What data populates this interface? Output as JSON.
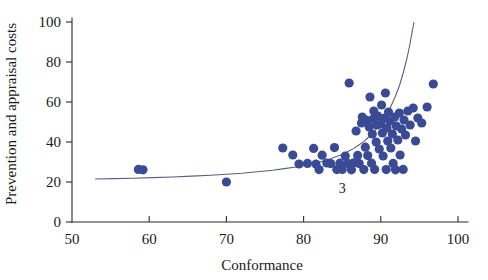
{
  "chart_data": {
    "type": "scatter",
    "title": "",
    "xlabel": "Conformance",
    "ylabel": "Prevention and appraisal costs",
    "xlim": [
      50,
      100
    ],
    "ylim": [
      0,
      100
    ],
    "xticks": [
      50,
      60,
      70,
      80,
      90,
      100
    ],
    "yticks": [
      0,
      20,
      40,
      60,
      80,
      100
    ],
    "grid": false,
    "legend": false,
    "marker_color": "#3a4a94",
    "curve_color": "#5a5f82",
    "axis_color": "#2b2b2b",
    "annotations": [
      {
        "text": "3",
        "x": 85.0,
        "y": 14.5
      }
    ],
    "series": [
      {
        "name": "observations",
        "marker": "circle",
        "points": [
          [
            58.6,
            26.3
          ],
          [
            59.2,
            26.1
          ],
          [
            70.0,
            20.0
          ],
          [
            77.3,
            37.0
          ],
          [
            78.6,
            33.5
          ],
          [
            79.4,
            29.0
          ],
          [
            80.5,
            29.3
          ],
          [
            81.3,
            36.8
          ],
          [
            81.6,
            29.0
          ],
          [
            82.0,
            26.2
          ],
          [
            82.4,
            33.4
          ],
          [
            83.0,
            29.5
          ],
          [
            83.5,
            29.2
          ],
          [
            84.0,
            37.2
          ],
          [
            84.3,
            26.2
          ],
          [
            84.7,
            29.4
          ],
          [
            85.0,
            26.3
          ],
          [
            85.4,
            33.0
          ],
          [
            85.7,
            29.3
          ],
          [
            85.9,
            69.5
          ],
          [
            86.2,
            26.1
          ],
          [
            86.5,
            29.6
          ],
          [
            86.8,
            45.5
          ],
          [
            87.0,
            33.3
          ],
          [
            87.2,
            29.2
          ],
          [
            87.5,
            49.5
          ],
          [
            87.6,
            52.5
          ],
          [
            87.8,
            26.2
          ],
          [
            88.0,
            37.4
          ],
          [
            88.1,
            51.0
          ],
          [
            88.3,
            33.2
          ],
          [
            88.5,
            47.5
          ],
          [
            88.6,
            62.5
          ],
          [
            88.8,
            29.4
          ],
          [
            88.9,
            44.0
          ],
          [
            89.0,
            51.5
          ],
          [
            89.1,
            55.5
          ],
          [
            89.2,
            26.3
          ],
          [
            89.4,
            40.0
          ],
          [
            89.5,
            48.5
          ],
          [
            89.6,
            53.0
          ],
          [
            89.8,
            36.5
          ],
          [
            90.0,
            49.0
          ],
          [
            90.1,
            58.5
          ],
          [
            90.2,
            44.5
          ],
          [
            90.3,
            33.0
          ],
          [
            90.5,
            52.0
          ],
          [
            90.6,
            64.5
          ],
          [
            90.7,
            26.2
          ],
          [
            90.8,
            47.0
          ],
          [
            90.9,
            40.5
          ],
          [
            91.0,
            55.0
          ],
          [
            91.2,
            50.5
          ],
          [
            91.3,
            37.0
          ],
          [
            91.5,
            44.0
          ],
          [
            91.6,
            29.3
          ],
          [
            91.8,
            52.5
          ],
          [
            91.9,
            26.1
          ],
          [
            92.0,
            48.0
          ],
          [
            92.2,
            41.0
          ],
          [
            92.4,
            54.5
          ],
          [
            92.5,
            33.5
          ],
          [
            92.7,
            46.5
          ],
          [
            92.9,
            26.3
          ],
          [
            93.0,
            51.0
          ],
          [
            93.2,
            43.5
          ],
          [
            93.5,
            55.5
          ],
          [
            93.8,
            48.5
          ],
          [
            94.2,
            57.0
          ],
          [
            94.5,
            40.5
          ],
          [
            94.8,
            52.0
          ],
          [
            95.3,
            49.5
          ],
          [
            96.0,
            57.5
          ],
          [
            96.8,
            69.0
          ]
        ]
      }
    ],
    "fit_curve": {
      "name": "exponential-fit",
      "points": [
        [
          53.0,
          21.5
        ],
        [
          58.0,
          21.9
        ],
        [
          63.0,
          22.5
        ],
        [
          68.0,
          23.4
        ],
        [
          72.0,
          24.4
        ],
        [
          76.0,
          25.9
        ],
        [
          79.0,
          27.5
        ],
        [
          81.5,
          29.4
        ],
        [
          83.5,
          31.6
        ],
        [
          85.0,
          33.8
        ],
        [
          86.5,
          36.8
        ],
        [
          87.8,
          40.2
        ],
        [
          88.8,
          43.8
        ],
        [
          89.7,
          47.8
        ],
        [
          90.5,
          52.2
        ],
        [
          91.2,
          57.0
        ],
        [
          91.8,
          62.0
        ],
        [
          92.4,
          68.0
        ],
        [
          92.9,
          74.5
        ],
        [
          93.4,
          82.0
        ],
        [
          93.8,
          89.5
        ],
        [
          94.1,
          96.0
        ],
        [
          94.3,
          100.0
        ]
      ]
    }
  }
}
